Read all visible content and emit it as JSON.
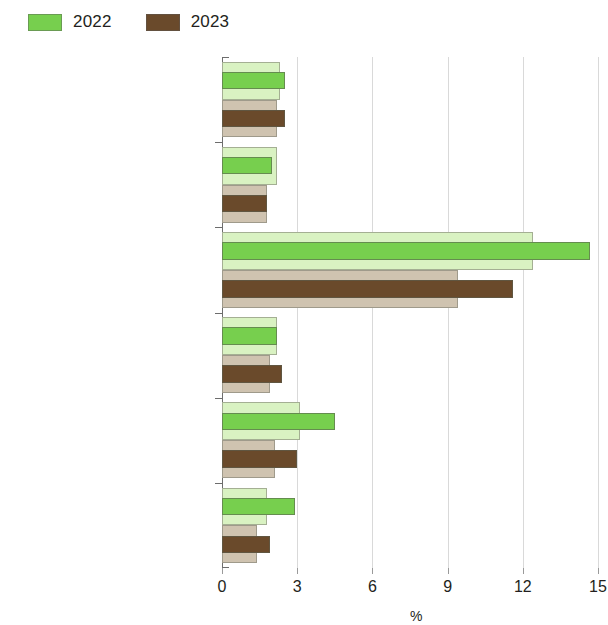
{
  "legend": {
    "entries": [
      {
        "label": "2022",
        "color": "#77cf4e",
        "swatch_name": "legend-swatch-2022"
      },
      {
        "label": "2023",
        "color": "#6a4a2b",
        "swatch_name": "legend-swatch-2023"
      }
    ]
  },
  "axis": {
    "x_title": "%",
    "x_ticks": [
      "0",
      "3",
      "6",
      "9",
      "12",
      "15"
    ]
  },
  "chart_data": {
    "type": "bar",
    "orientation": "horizontal",
    "title": "",
    "subtitle": "",
    "xlabel": "%",
    "ylabel": "",
    "xlim": [
      0,
      15
    ],
    "xticks": [
      0,
      3,
      6,
      9,
      12,
      15
    ],
    "grid": true,
    "legend_position": "top-left",
    "categories": [
      "East Asia",
      "Hong Kong, China",
      "Mongolia",
      "People's Republic of China",
      "Republic of Korea",
      "Taipei,China"
    ],
    "emphasized_category": "East Asia",
    "series": [
      {
        "name": "2022",
        "color": "#77cf4e",
        "pale_color": "#d9f2c2",
        "values": [
          2.5,
          2.0,
          14.7,
          2.2,
          4.5,
          2.9
        ],
        "outline_values": [
          2.3,
          2.2,
          12.4,
          2.2,
          3.1,
          1.8
        ]
      },
      {
        "name": "2023",
        "color": "#6a4a2b",
        "pale_color": "#cfc3b0",
        "values": [
          2.5,
          1.8,
          11.6,
          2.4,
          3.0,
          1.9
        ],
        "outline_values": [
          2.2,
          1.8,
          9.4,
          1.9,
          2.1,
          1.4
        ]
      }
    ]
  }
}
